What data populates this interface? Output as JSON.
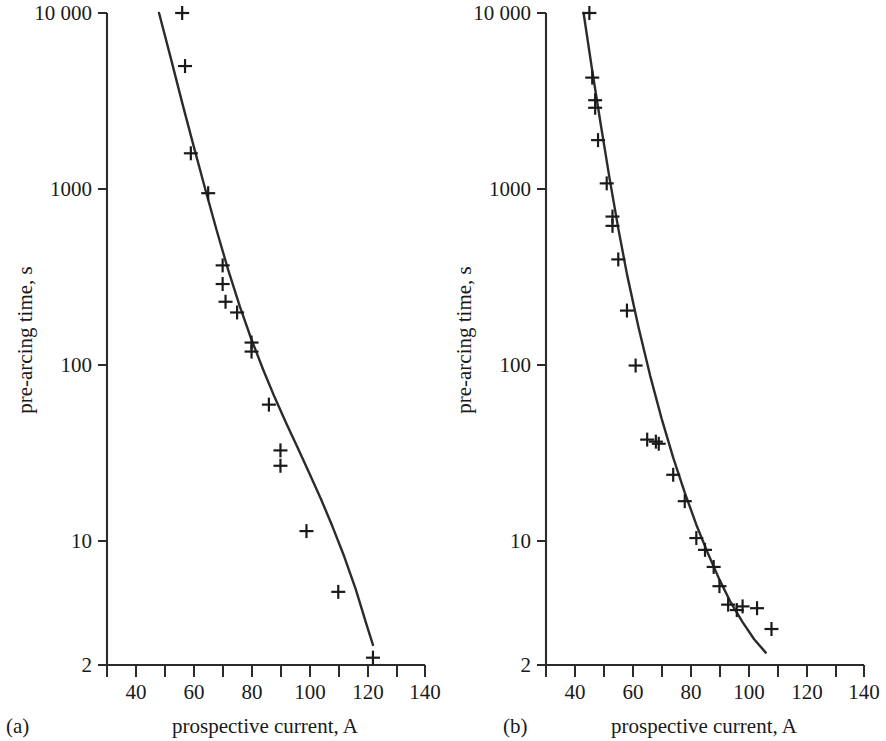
{
  "figure": {
    "background_color": "#ffffff",
    "ink_color": "#2b2b2b",
    "marker_symbol": "plus"
  },
  "panels": [
    {
      "tag": "(a)",
      "xlabel": "prospective current, A",
      "ylabel": "pre-arcing time, s"
    },
    {
      "tag": "(b)",
      "xlabel": "prospective current, A",
      "ylabel": "pre-arcing time, s"
    }
  ],
  "chart_data": [
    {
      "type": "scatter",
      "title": "",
      "panel_tag": "(a)",
      "xlabel": "prospective current, A",
      "ylabel": "pre-arcing time, s",
      "xscale": "linear",
      "yscale": "log",
      "xlim": [
        30,
        140
      ],
      "ylim": [
        2,
        10000
      ],
      "xticks": [
        30,
        40,
        50,
        60,
        70,
        80,
        90,
        100,
        110,
        120,
        130,
        140
      ],
      "xtick_labels": [
        "",
        "40",
        "",
        "60",
        "",
        "80",
        "",
        "100",
        "",
        "120",
        "",
        "140"
      ],
      "yticks": [
        2,
        10,
        100,
        1000,
        10000
      ],
      "ytick_labels": [
        "2",
        "10",
        "100",
        "1000",
        "10 000"
      ],
      "grid": false,
      "legend": "none",
      "series": [
        {
          "name": "measured pre-arcing times",
          "marker": "plus",
          "x": [
            56,
            57,
            59,
            65,
            70,
            70,
            71,
            75,
            80,
            80,
            86,
            90,
            90,
            99,
            110,
            122
          ],
          "y": [
            10000,
            5000,
            1600,
            950,
            370,
            290,
            230,
            200,
            135,
            120,
            60,
            33,
            27,
            11.5,
            5.2,
            2.2
          ]
        },
        {
          "name": "fitted characteristic curve",
          "marker": "line",
          "x": [
            48,
            52,
            56,
            60,
            64,
            68,
            72,
            76,
            80,
            84,
            88,
            92,
            96,
            100,
            104,
            108,
            112,
            116,
            120,
            122
          ],
          "y": [
            10000,
            5600,
            3100,
            1750,
            1000,
            580,
            345,
            215,
            140,
            95,
            66,
            47,
            34,
            24.5,
            17.5,
            12.2,
            8.3,
            5.4,
            3.3,
            2.6
          ]
        }
      ]
    },
    {
      "type": "scatter",
      "title": "",
      "panel_tag": "(b)",
      "xlabel": "prospective current, A",
      "ylabel": "pre-arcing time, s",
      "xscale": "linear",
      "yscale": "log",
      "xlim": [
        30,
        140
      ],
      "ylim": [
        2,
        10000
      ],
      "xticks": [
        30,
        40,
        50,
        60,
        70,
        80,
        90,
        100,
        110,
        120,
        130,
        140
      ],
      "xtick_labels": [
        "",
        "40",
        "",
        "60",
        "",
        "80",
        "",
        "100",
        "",
        "120",
        "",
        "140"
      ],
      "yticks": [
        2,
        10,
        100,
        1000,
        10000
      ],
      "ytick_labels": [
        "2",
        "10",
        "100",
        "1000",
        "10 000"
      ],
      "grid": false,
      "legend": "none",
      "series": [
        {
          "name": "measured pre-arcing times",
          "marker": "plus",
          "x": [
            45,
            46,
            47,
            47,
            48,
            51,
            53,
            53,
            55,
            58,
            61,
            65,
            68,
            69,
            74,
            78,
            82,
            85,
            88,
            90,
            93,
            96,
            98,
            103,
            108
          ],
          "y": [
            10000,
            4300,
            3200,
            2900,
            1900,
            1080,
            700,
            620,
            400,
            205,
            100,
            38,
            37,
            36,
            24,
            17,
            10.5,
            9.0,
            7.2,
            5.6,
            4.4,
            4.1,
            4.3,
            4.2,
            3.2
          ]
        },
        {
          "name": "fitted characteristic curve",
          "marker": "line",
          "x": [
            43,
            46,
            49,
            52,
            55,
            58,
            62,
            66,
            70,
            74,
            78,
            82,
            86,
            90,
            94,
            98,
            102,
            106
          ],
          "y": [
            10000,
            4700,
            2300,
            1150,
            600,
            330,
            165,
            88,
            50,
            30,
            19,
            12.5,
            8.6,
            6.1,
            4.5,
            3.5,
            2.8,
            2.35
          ]
        }
      ]
    }
  ]
}
